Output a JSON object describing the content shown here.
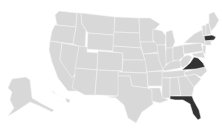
{
  "map": {
    "title": "United States",
    "default_fill": "#d8d8d8",
    "highlight_fill": "#333333",
    "border_color": "#f2f2f2",
    "background": "#ffffff",
    "highlighted_states": [
      "Massachusetts",
      "Virginia",
      "Florida"
    ],
    "states": {
      "wa": "Washington",
      "or": "Oregon",
      "ca": "California",
      "nv": "Nevada",
      "id": "Idaho",
      "mt": "Montana",
      "wy": "Wyoming",
      "ut": "Utah",
      "az": "Arizona",
      "co": "Colorado",
      "nm": "New Mexico",
      "nd": "North Dakota",
      "sd": "South Dakota",
      "ne": "Nebraska",
      "ks": "Kansas",
      "ok": "Oklahoma",
      "tx": "Texas",
      "mn": "Minnesota",
      "ia": "Iowa",
      "mo": "Missouri",
      "ar": "Arkansas",
      "la": "Louisiana",
      "wi": "Wisconsin",
      "il": "Illinois",
      "mi": "Michigan",
      "in": "Indiana",
      "oh": "Ohio",
      "ky": "Kentucky",
      "tn": "Tennessee",
      "ms": "Mississippi",
      "al": "Alabama",
      "ga": "Georgia",
      "fl": "Florida",
      "sc": "South Carolina",
      "nc": "North Carolina",
      "va": "Virginia",
      "wv": "West Virginia",
      "pa": "Pennsylvania",
      "ny": "New York",
      "me": "Maine",
      "vt": "Vermont",
      "nh": "New Hampshire",
      "ma": "Massachusetts",
      "ak": "Alaska",
      "hi": "Hawaii"
    }
  }
}
